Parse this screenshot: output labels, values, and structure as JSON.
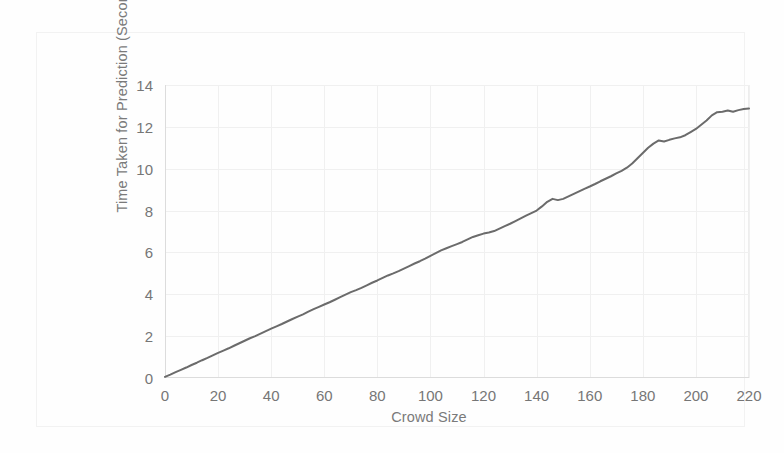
{
  "figure": {
    "background_color": "#ffffff",
    "frame_color": "#f2f2f2"
  },
  "chart_data": {
    "type": "line",
    "title": "",
    "xlabel": "Crowd Size",
    "ylabel": "Time Taken for Prediction (Seconds)",
    "xlim": [
      0,
      220
    ],
    "ylim": [
      0,
      14
    ],
    "xticks": [
      0,
      20,
      40,
      60,
      80,
      100,
      120,
      140,
      160,
      180,
      200,
      220
    ],
    "yticks": [
      0,
      2,
      4,
      6,
      8,
      10,
      12,
      14
    ],
    "grid": true,
    "grid_color": "#f0f0f0",
    "legend": null,
    "legend_position": "none",
    "line_color": "#6b6b6b",
    "line_width": 2.0,
    "series": [
      {
        "name": "Prediction time",
        "x": [
          0,
          2,
          4,
          6,
          8,
          10,
          12,
          14,
          16,
          18,
          20,
          22,
          24,
          26,
          28,
          30,
          32,
          34,
          36,
          38,
          40,
          42,
          44,
          46,
          48,
          50,
          52,
          54,
          56,
          58,
          60,
          62,
          64,
          66,
          68,
          70,
          72,
          74,
          76,
          78,
          80,
          82,
          84,
          86,
          88,
          90,
          92,
          94,
          96,
          98,
          100,
          102,
          104,
          106,
          108,
          110,
          112,
          114,
          116,
          118,
          120,
          122,
          124,
          126,
          128,
          130,
          132,
          134,
          136,
          138,
          140,
          142,
          144,
          146,
          148,
          150,
          152,
          154,
          156,
          158,
          160,
          162,
          164,
          166,
          168,
          170,
          172,
          174,
          176,
          178,
          180,
          182,
          184,
          186,
          188,
          190,
          192,
          194,
          196,
          198,
          200,
          202,
          204,
          206,
          208,
          210,
          212,
          214,
          216,
          218,
          220
        ],
        "y": [
          0.05,
          0.16,
          0.28,
          0.39,
          0.5,
          0.62,
          0.73,
          0.85,
          0.96,
          1.08,
          1.2,
          1.31,
          1.42,
          1.54,
          1.66,
          1.78,
          1.9,
          2.0,
          2.12,
          2.24,
          2.36,
          2.47,
          2.58,
          2.7,
          2.82,
          2.93,
          3.04,
          3.17,
          3.29,
          3.4,
          3.51,
          3.62,
          3.74,
          3.86,
          3.98,
          4.1,
          4.2,
          4.31,
          4.43,
          4.55,
          4.66,
          4.78,
          4.9,
          5.0,
          5.11,
          5.23,
          5.35,
          5.47,
          5.58,
          5.7,
          5.84,
          5.97,
          6.1,
          6.2,
          6.3,
          6.4,
          6.5,
          6.62,
          6.74,
          6.82,
          6.9,
          6.95,
          7.02,
          7.14,
          7.26,
          7.37,
          7.5,
          7.63,
          7.76,
          7.88,
          8.0,
          8.2,
          8.42,
          8.56,
          8.5,
          8.56,
          8.68,
          8.8,
          8.92,
          9.04,
          9.15,
          9.27,
          9.4,
          9.52,
          9.64,
          9.78,
          9.9,
          10.05,
          10.25,
          10.5,
          10.75,
          11.0,
          11.2,
          11.35,
          11.3,
          11.38,
          11.45,
          11.5,
          11.6,
          11.75,
          11.9,
          12.1,
          12.3,
          12.55,
          12.7,
          12.72,
          12.78,
          12.72,
          12.8,
          12.85,
          12.88
        ]
      }
    ]
  }
}
